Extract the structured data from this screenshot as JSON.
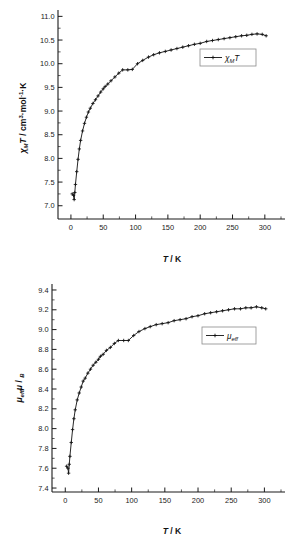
{
  "figure": {
    "name": "magnetic-susceptibility-figure",
    "background": "#ffffff",
    "line_color": "#111111",
    "axis_color": "#1a1a1a"
  },
  "chart_data": [
    {
      "id": "chi-m-t-vs-temperature",
      "type": "line",
      "title": "",
      "xlabel": "T / K",
      "ylabel": "χMT / cm3·mol-1·K",
      "ylabel_parts": {
        "sym": "χ",
        "sym_sub": "M",
        "sym2": "T",
        "unit_head": " / cm",
        "unit_sup1": "3",
        "unit_mid": "·mol",
        "unit_sup2": "-1",
        "unit_tail": "·K"
      },
      "xlabel_parts": {
        "ital": "T",
        "reg": " / K"
      },
      "xlim": [
        -20,
        325
      ],
      "ylim": [
        6.72,
        11.05
      ],
      "xticks": [
        0,
        50,
        100,
        150,
        200,
        250,
        300
      ],
      "xtick_labels": [
        "0",
        "50",
        "100",
        "150",
        "200",
        "250",
        "300"
      ],
      "yticks": [
        7.0,
        7.5,
        8.0,
        8.5,
        9.0,
        9.5,
        10.0,
        10.5,
        11.0
      ],
      "ytick_labels": [
        "7.0",
        "7.5",
        "8.0",
        "8.5",
        "9.0",
        "9.5",
        "10.0",
        "10.5",
        "11.0"
      ],
      "x_minor_count": 1,
      "y_minor_count": 1,
      "grid": false,
      "legend": {
        "label": "χMT",
        "sym": "χ",
        "sub": "M",
        "tail": "T",
        "position": "center-right"
      },
      "marker": "plus",
      "series": [
        {
          "name": "χMT",
          "x": [
            2,
            4,
            5,
            6,
            7,
            9,
            11,
            13,
            15,
            18,
            21,
            24,
            27,
            30,
            34,
            38,
            42,
            46,
            50,
            53,
            57,
            62,
            68,
            74,
            80,
            88,
            95,
            103,
            111,
            120,
            128,
            137,
            146,
            155,
            164,
            173,
            182,
            191,
            200,
            210,
            219,
            228,
            237,
            246,
            255,
            264,
            272,
            280,
            288,
            296,
            302
          ],
          "y": [
            7.25,
            7.22,
            7.13,
            7.28,
            7.45,
            7.72,
            7.98,
            8.2,
            8.38,
            8.58,
            8.74,
            8.87,
            8.98,
            9.06,
            9.16,
            9.24,
            9.32,
            9.4,
            9.47,
            9.52,
            9.57,
            9.64,
            9.72,
            9.8,
            9.87,
            9.87,
            9.88,
            10.0,
            10.07,
            10.14,
            10.19,
            10.23,
            10.26,
            10.29,
            10.32,
            10.35,
            10.38,
            10.41,
            10.43,
            10.47,
            10.49,
            10.51,
            10.53,
            10.55,
            10.57,
            10.59,
            10.6,
            10.62,
            10.63,
            10.62,
            10.59
          ]
        }
      ]
    },
    {
      "id": "mu-eff-vs-temperature",
      "type": "line",
      "title": "",
      "xlabel": "T / K",
      "ylabel": "μeff / μB",
      "ylabel_parts": {
        "sym": "μ",
        "sym_sub": "eff",
        "mid": " / ",
        "sym2": "μ",
        "sym2_sub": "B"
      },
      "xlabel_parts": {
        "ital": "T",
        "reg": " / K"
      },
      "xlim": [
        -20,
        325
      ],
      "ylim": [
        7.36,
        9.42
      ],
      "xticks": [
        0,
        50,
        100,
        150,
        200,
        250,
        300
      ],
      "xtick_labels": [
        "0",
        "50",
        "100",
        "150",
        "200",
        "250",
        "300"
      ],
      "yticks": [
        7.4,
        7.6,
        7.8,
        8.0,
        8.2,
        8.4,
        8.6,
        8.8,
        9.0,
        9.2,
        9.4
      ],
      "ytick_labels": [
        "7.4",
        "7.6",
        "7.8",
        "8.0",
        "8.2",
        "8.4",
        "8.6",
        "8.8",
        "9.0",
        "9.2",
        "9.4"
      ],
      "x_minor_count": 1,
      "y_minor_count": 1,
      "grid": false,
      "legend": {
        "label": "μeff",
        "sym": "μ",
        "sub": "eff",
        "position": "center-right"
      },
      "marker": "plus",
      "series": [
        {
          "name": "μeff",
          "x": [
            2,
            4,
            5,
            6,
            7,
            9,
            11,
            13,
            15,
            18,
            21,
            24,
            27,
            30,
            34,
            38,
            42,
            46,
            50,
            53,
            57,
            62,
            68,
            74,
            80,
            88,
            95,
            103,
            111,
            120,
            128,
            137,
            146,
            155,
            164,
            173,
            182,
            191,
            200,
            210,
            219,
            228,
            237,
            246,
            255,
            264,
            272,
            280,
            288,
            296,
            302
          ],
          "y": [
            7.62,
            7.6,
            7.55,
            7.64,
            7.72,
            7.86,
            7.99,
            8.1,
            8.19,
            8.29,
            8.36,
            8.42,
            8.48,
            8.51,
            8.56,
            8.6,
            8.64,
            8.67,
            8.7,
            8.73,
            8.75,
            8.79,
            8.82,
            8.86,
            8.89,
            8.89,
            8.89,
            8.94,
            8.98,
            9.01,
            9.03,
            9.05,
            9.06,
            9.07,
            9.09,
            9.1,
            9.11,
            9.13,
            9.14,
            9.16,
            9.17,
            9.18,
            9.19,
            9.2,
            9.21,
            9.21,
            9.22,
            9.22,
            9.23,
            9.22,
            9.21
          ]
        }
      ]
    }
  ]
}
